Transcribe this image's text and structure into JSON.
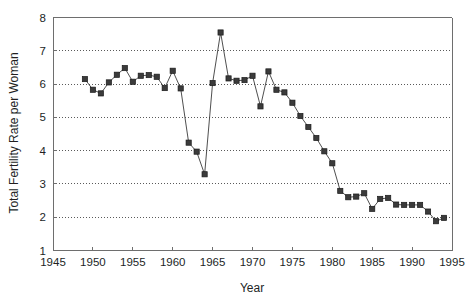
{
  "chart_data": {
    "type": "line",
    "title": "",
    "xlabel": "Year",
    "ylabel": "Total Fertility Rate per Woman",
    "xlim": [
      1945,
      1995
    ],
    "ylim": [
      1,
      8
    ],
    "xticks": [
      1945,
      1950,
      1955,
      1960,
      1965,
      1970,
      1975,
      1980,
      1985,
      1990,
      1995
    ],
    "yticks": [
      1,
      2,
      3,
      4,
      5,
      6,
      7,
      8
    ],
    "grid": "horizontal-dotted",
    "legend": "none",
    "marker": "filled-square",
    "line_color": "#3b3b3b",
    "marker_color": "#3b3b3b",
    "series": [
      {
        "name": "Total Fertility Rate per Woman",
        "x": [
          1949,
          1950,
          1951,
          1952,
          1953,
          1954,
          1955,
          1956,
          1957,
          1958,
          1959,
          1960,
          1961,
          1962,
          1963,
          1964,
          1965,
          1966,
          1967,
          1968,
          1969,
          1970,
          1971,
          1972,
          1973,
          1974,
          1975,
          1976,
          1977,
          1978,
          1979,
          1980,
          1981,
          1982,
          1983,
          1984,
          1985,
          1986,
          1987,
          1988,
          1989,
          1990,
          1991,
          1992,
          1993,
          1994
        ],
        "values": [
          6.15,
          5.83,
          5.72,
          6.05,
          6.28,
          6.48,
          6.07,
          6.25,
          6.27,
          6.22,
          5.88,
          6.4,
          5.87,
          4.24,
          3.97,
          3.29,
          6.03,
          7.55,
          6.17,
          6.1,
          6.12,
          6.25,
          5.33,
          6.38,
          5.83,
          5.75,
          5.44,
          5.04,
          4.71,
          4.38,
          3.98,
          3.62,
          2.79,
          2.6,
          2.62,
          2.72,
          2.25,
          2.55,
          2.58,
          2.38,
          2.37,
          2.37,
          2.37,
          2.17,
          1.88,
          1.98
        ]
      }
    ]
  },
  "axis": {
    "x_tick_labels": [
      "1945",
      "1950",
      "1955",
      "1960",
      "1965",
      "1970",
      "1975",
      "1980",
      "1985",
      "1990",
      "1995"
    ],
    "y_tick_labels": [
      "1",
      "2",
      "3",
      "4",
      "5",
      "6",
      "7",
      "8"
    ],
    "x_axis_title": "Year",
    "y_axis_title": "Total Fertility Rate per Woman"
  }
}
